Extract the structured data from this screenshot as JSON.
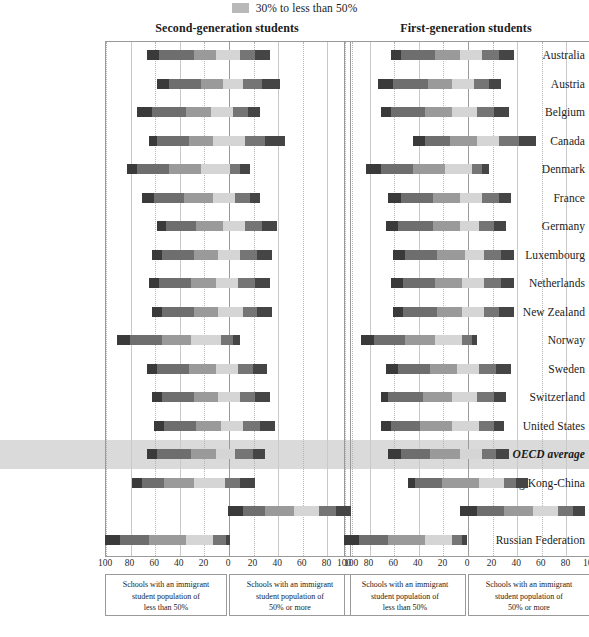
{
  "legend": {
    "swatch_color": "#b9b9b9",
    "label": "30% to less than 50%"
  },
  "panels": {
    "left": {
      "title": "Second-generation students"
    },
    "right": {
      "title": "First-generation students"
    }
  },
  "axis": {
    "ticks": [
      "100",
      "80",
      "60",
      "40",
      "20",
      "0",
      "20",
      "40",
      "60",
      "80",
      "100"
    ],
    "tick_values": [
      -100,
      -80,
      -60,
      -40,
      -20,
      0,
      20,
      40,
      60,
      80,
      100
    ],
    "min": -100,
    "max": 100
  },
  "captions": {
    "less_than_50": [
      "Schools with an immigrant",
      "student population of",
      "less than 50%"
    ],
    "50_or_more": [
      "Schools with an immigrant",
      "student population of",
      "50% or more"
    ]
  },
  "series_colors": {
    "s1": "#3a3a3a",
    "s2": "#6e6e6e",
    "s3": "#9a9a9a",
    "s4": "#d5d5d5",
    "s5": "#757575",
    "s6": "#454545"
  },
  "highlight_color": "#d3d3d3",
  "chart_data": {
    "type": "bar",
    "subtype": "diverging-stacked-horizontal",
    "xlabel": "",
    "ylabel": "",
    "xlim": [
      -100,
      100
    ],
    "grid": true,
    "legend_position": "top-center",
    "panels": [
      "Second-generation students",
      "First-generation students"
    ],
    "categories": [
      "Australia",
      "Austria",
      "Belgium",
      "Canada",
      "Denmark",
      "France",
      "Germany",
      "Luxembourg",
      "Netherlands",
      "New Zealand",
      "Norway",
      "Sweden",
      "Switzerland",
      "United States",
      "OECD average",
      "Hong Kong-China",
      "Macao-China",
      "Russian Federation"
    ],
    "highlight_category": "OECD average",
    "note": "Each bar is drawn from its start to end value on a -100..100 axis; segments are sub-spans in axis units.",
    "second_generation": [
      {
        "country": "Australia",
        "start": -66,
        "end": 34,
        "segments": [
          -66,
          -56,
          -28,
          -10,
          10,
          22,
          34
        ]
      },
      {
        "country": "Austria",
        "start": -58,
        "end": 42,
        "segments": [
          -58,
          -48,
          -22,
          -4,
          12,
          28,
          42
        ]
      },
      {
        "country": "Belgium",
        "start": -74,
        "end": 26,
        "segments": [
          -74,
          -62,
          -34,
          -14,
          4,
          16,
          26
        ]
      },
      {
        "country": "Canada",
        "start": -64,
        "end": 46,
        "segments": [
          -64,
          -58,
          -32,
          -12,
          14,
          30,
          46
        ]
      },
      {
        "country": "Denmark",
        "start": -82,
        "end": 18,
        "segments": [
          -82,
          -74,
          -48,
          -22,
          2,
          10,
          18
        ]
      },
      {
        "country": "France",
        "start": -70,
        "end": 26,
        "segments": [
          -70,
          -60,
          -36,
          -12,
          6,
          18,
          26
        ]
      },
      {
        "country": "Germany",
        "start": -58,
        "end": 40,
        "segments": [
          -58,
          -50,
          -26,
          -4,
          14,
          28,
          40
        ]
      },
      {
        "country": "Luxembourg",
        "start": -62,
        "end": 36,
        "segments": [
          -62,
          -54,
          -28,
          -8,
          10,
          24,
          36
        ]
      },
      {
        "country": "Netherlands",
        "start": -64,
        "end": 34,
        "segments": [
          -64,
          -56,
          -30,
          -10,
          8,
          22,
          34
        ]
      },
      {
        "country": "New Zealand",
        "start": -62,
        "end": 36,
        "segments": [
          -62,
          -54,
          -28,
          -8,
          12,
          24,
          36
        ]
      },
      {
        "country": "Norway",
        "start": -90,
        "end": 10,
        "segments": [
          -90,
          -80,
          -54,
          -30,
          -6,
          4,
          10
        ]
      },
      {
        "country": "Sweden",
        "start": -66,
        "end": 32,
        "segments": [
          -66,
          -58,
          -32,
          -10,
          8,
          20,
          32
        ]
      },
      {
        "country": "Switzerland",
        "start": -62,
        "end": 34,
        "segments": [
          -62,
          -54,
          -28,
          -8,
          10,
          22,
          34
        ]
      },
      {
        "country": "United States",
        "start": -60,
        "end": 38,
        "segments": [
          -60,
          -52,
          -26,
          -6,
          12,
          26,
          38
        ]
      },
      {
        "country": "OECD average",
        "start": -66,
        "end": 30,
        "segments": [
          -66,
          -58,
          -30,
          -10,
          6,
          20,
          30
        ]
      },
      {
        "country": "Hong Kong-China",
        "start": -78,
        "end": 22,
        "segments": [
          -78,
          -70,
          -52,
          -28,
          -2,
          10,
          22
        ]
      },
      {
        "country": "Macao-China",
        "start": 0,
        "end": 100,
        "segments": [
          0,
          12,
          30,
          54,
          74,
          88,
          100
        ]
      },
      {
        "country": "Russian Federation",
        "start": -100,
        "end": 2,
        "segments": [
          -100,
          -88,
          -64,
          -34,
          -12,
          -2,
          2
        ]
      }
    ],
    "first_generation": [
      {
        "country": "Australia",
        "start": -62,
        "end": 38,
        "segments": [
          -62,
          -54,
          -26,
          -6,
          12,
          26,
          38
        ]
      },
      {
        "country": "Austria",
        "start": -72,
        "end": 28,
        "segments": [
          -72,
          -60,
          -32,
          -12,
          6,
          18,
          28
        ]
      },
      {
        "country": "Belgium",
        "start": -70,
        "end": 34,
        "segments": [
          -70,
          -62,
          -34,
          -12,
          8,
          22,
          34
        ]
      },
      {
        "country": "Canada",
        "start": -44,
        "end": 56,
        "segments": [
          -44,
          -34,
          -14,
          8,
          26,
          42,
          56
        ]
      },
      {
        "country": "Denmark",
        "start": -82,
        "end": 18,
        "segments": [
          -82,
          -70,
          -44,
          -18,
          4,
          12,
          18
        ]
      },
      {
        "country": "France",
        "start": -64,
        "end": 36,
        "segments": [
          -64,
          -54,
          -28,
          -6,
          12,
          26,
          36
        ]
      },
      {
        "country": "Germany",
        "start": -66,
        "end": 32,
        "segments": [
          -66,
          -56,
          -28,
          -6,
          10,
          22,
          32
        ]
      },
      {
        "country": "Luxembourg",
        "start": -60,
        "end": 38,
        "segments": [
          -60,
          -50,
          -24,
          -2,
          14,
          28,
          38
        ]
      },
      {
        "country": "Netherlands",
        "start": -62,
        "end": 38,
        "segments": [
          -62,
          -52,
          -26,
          -4,
          14,
          28,
          38
        ]
      },
      {
        "country": "New Zealand",
        "start": -60,
        "end": 38,
        "segments": [
          -60,
          -52,
          -24,
          -4,
          14,
          26,
          38
        ]
      },
      {
        "country": "Norway",
        "start": -86,
        "end": 8,
        "segments": [
          -86,
          -76,
          -50,
          -26,
          -4,
          4,
          8
        ]
      },
      {
        "country": "Sweden",
        "start": -66,
        "end": 36,
        "segments": [
          -66,
          -56,
          -30,
          -8,
          10,
          24,
          36
        ]
      },
      {
        "country": "Switzerland",
        "start": -70,
        "end": 32,
        "segments": [
          -70,
          -64,
          -36,
          -12,
          8,
          22,
          32
        ]
      },
      {
        "country": "United States",
        "start": -70,
        "end": 30,
        "segments": [
          -70,
          -62,
          -38,
          -12,
          10,
          22,
          30
        ]
      },
      {
        "country": "OECD average",
        "start": -64,
        "end": 34,
        "segments": [
          -64,
          -54,
          -30,
          -6,
          12,
          24,
          34
        ]
      },
      {
        "country": "Hong Kong-China",
        "start": -48,
        "end": 50,
        "segments": [
          -48,
          -42,
          -20,
          10,
          30,
          40,
          50
        ]
      },
      {
        "country": "Macao-China",
        "start": -6,
        "end": 96,
        "segments": [
          -6,
          8,
          30,
          54,
          74,
          86,
          96
        ]
      },
      {
        "country": "Russian Federation",
        "start": -100,
        "end": 0,
        "segments": [
          -100,
          -88,
          -64,
          -34,
          -12,
          -4,
          0
        ]
      }
    ]
  }
}
